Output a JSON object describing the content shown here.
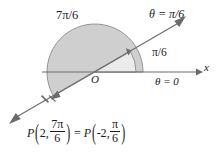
{
  "figure": {
    "origin_label": "O",
    "axis_label_x": "x",
    "labels": {
      "outer_angle": "7π/6",
      "inner_angle": "π/6",
      "terminal_ray": "θ = π/6",
      "initial_ray": "θ = 0"
    },
    "equation": {
      "point_symbol": "P",
      "left_radius": "2",
      "left_angle_numerator": "7π",
      "left_angle_denominator": "6",
      "equals": "=",
      "right_radius": "-2",
      "right_angle_numerator": "π",
      "right_angle_denominator": "6",
      "open_paren": "(",
      "close_paren": ")",
      "comma": ","
    },
    "colors": {
      "line": "#6b6b6b",
      "text": "#1a1a1a",
      "outer_sector_fill": "#cfcfcf",
      "inner_sector_fill": "#ebebeb",
      "sector_stroke": "#8a8a8a",
      "background": "#ffffff"
    },
    "geometry": {
      "origin_x": 95,
      "origin_y": 72,
      "ray_angle_degrees": 30,
      "outer_sweep_degrees": 210,
      "outer_radius": 48,
      "inner_radius": 41,
      "axis_tip_x": 201,
      "point_marker_x": 45,
      "point_marker_y": 99
    }
  }
}
